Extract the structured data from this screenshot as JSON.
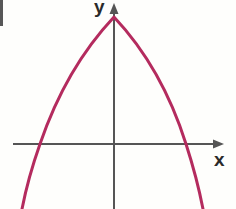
{
  "figure": {
    "background_color": "#FEFEFC",
    "width": 236,
    "height": 209
  },
  "axes": {
    "color": "#555555",
    "stroke_width": 2,
    "x_axis": {
      "label": "x",
      "label_color": "#2A2A2A",
      "y_pixel": 144,
      "start_x": 13,
      "end_x": 224,
      "arrow": "right-arrowhead"
    },
    "y_axis": {
      "label": "y",
      "label_color": "#2A2A2A",
      "x_pixel": 114,
      "start_y": 4,
      "end_y": 209,
      "arrow": "up-arrowhead"
    },
    "origin": {
      "x": 114,
      "y": 144
    },
    "ticks": [],
    "gridlines": false
  },
  "curve": {
    "name": "parabola",
    "color": "#B42B5E",
    "stroke_width": 3,
    "opens": "down",
    "vertex_pixel": {
      "x": 114,
      "y": 17
    },
    "x_intercepts_pixel": [
      40,
      186
    ],
    "path": "M 22 209 Q 28 178 40 144 Q 66 68 114 17 Q 162 68 186 144 Q 197 178 203 209"
  },
  "chart_data": {
    "type": "line",
    "title": "",
    "xlabel": "x",
    "ylabel": "y",
    "grid": false,
    "legend": "none",
    "xlim": [
      -3.05,
      2.75
    ],
    "ylim": [
      -2.3,
      4.3
    ],
    "series": [
      {
        "name": "parabola",
        "color": "#B42B5E",
        "equation": "y = -a(x - h)^2 + k",
        "vertex": [
          0,
          3.4
        ],
        "roots": [
          -2.0,
          1.9
        ],
        "x": [
          -2.5,
          -2.25,
          -2.0,
          -1.75,
          -1.5,
          -1.25,
          -1.0,
          -0.75,
          -0.5,
          -0.25,
          0.0,
          0.25,
          0.5,
          0.75,
          1.0,
          1.25,
          1.5,
          1.75,
          2.0,
          2.25,
          2.5
        ],
        "y": [
          -2.0,
          -0.9,
          0.0,
          0.8,
          1.5,
          2.1,
          2.55,
          2.95,
          3.2,
          3.35,
          3.4,
          3.35,
          3.2,
          2.95,
          2.55,
          2.1,
          1.5,
          0.8,
          0.0,
          -0.9,
          -2.0
        ]
      }
    ],
    "annotations": [
      {
        "text": "x",
        "position": "x-axis-arrow-end"
      },
      {
        "text": "y",
        "position": "y-axis-arrow-top"
      }
    ]
  },
  "artifacts": {
    "top_left_scan_edge": {
      "name": "scan-edge-artifact",
      "color": "#3A3A3A"
    }
  }
}
